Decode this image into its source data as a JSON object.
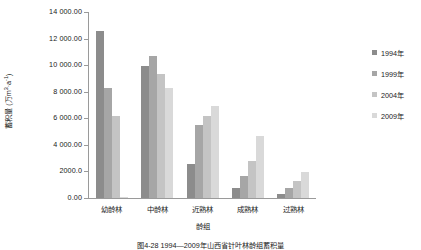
{
  "chart_data": {
    "type": "bar",
    "title": "",
    "xlabel": "龄组",
    "ylabel": "蓄积量 (万m3·a-1)",
    "ylabel_main": "蓄积量 (万m",
    "ylabel_sup1": "3",
    "ylabel_mid": "·a",
    "ylabel_sup2": "-1",
    "ylabel_end": ")",
    "categories": [
      "幼龄林",
      "中龄林",
      "近熟林",
      "成熟林",
      "过熟林"
    ],
    "ylim": [
      0,
      14000
    ],
    "yticks": [
      0,
      2000,
      4000,
      6000,
      8000,
      10000,
      12000,
      14000
    ],
    "ytick_labels": [
      "0.00",
      "2000.0",
      "4 000.00",
      "6 000.00",
      "8 000.00",
      "10 000.00",
      "12 000.00",
      "14 000.00"
    ],
    "grid": false,
    "legend_position": "right",
    "series": [
      {
        "name": "1994年",
        "color": "#8c8c8c",
        "values": [
          12600,
          9950,
          2580,
          790,
          330
        ]
      },
      {
        "name": "1999年",
        "color": "#a6a6a6",
        "values": [
          8280,
          10700,
          5480,
          1660,
          780
        ]
      },
      {
        "name": "2004年",
        "color": "#c4c4c4",
        "values": [
          6180,
          9330,
          6200,
          2810,
          1300
        ]
      },
      {
        "name": "2009年",
        "color": "#d9d9d9",
        "values": [
          60,
          8250,
          6950,
          4700,
          1960
        ]
      }
    ]
  },
  "caption": {
    "text": "图4-28  1994—2009年山西省针叶林龄组蓄积量"
  }
}
